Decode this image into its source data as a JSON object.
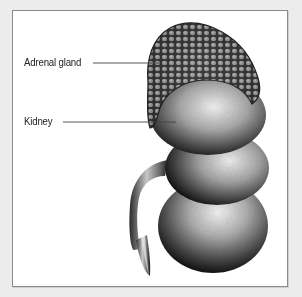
{
  "figure": {
    "background_color": "#ececec",
    "frame_color": "#ffffff",
    "frame_border_color": "#8a8a8a"
  },
  "labels": [
    {
      "text": "Adrenal gland",
      "target": "adrenal-gland"
    },
    {
      "text": "Kidney",
      "target": "kidney"
    }
  ]
}
